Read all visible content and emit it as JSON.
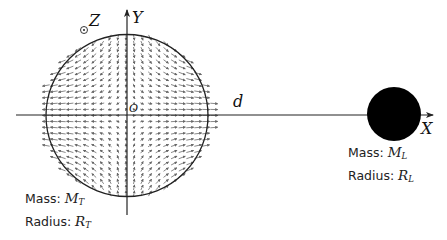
{
  "diagram": {
    "axes": {
      "x_label": "X",
      "y_label": "Y",
      "z_label": "Z",
      "origin_label": "O",
      "distance_label": "d"
    },
    "earth": {
      "center": [
        127,
        115
      ],
      "radius": 81,
      "mass_prefix": "Mass: ",
      "mass_symbol": "M",
      "mass_sub": "T",
      "radius_prefix": "Radius: ",
      "radius_symbol": "R",
      "radius_sub": "T"
    },
    "moon": {
      "center": [
        394,
        114
      ],
      "radius": 27,
      "color": "#000000",
      "mass_prefix": "Mass: ",
      "mass_symbol": "M",
      "mass_sub": "L",
      "radius_prefix": "Radius: ",
      "radius_symbol": "R",
      "radius_sub": "L"
    },
    "field": {
      "type": "tidal",
      "grid_dx": 8,
      "grid_dy": 6,
      "color": "#555555"
    },
    "colors": {
      "line": "#222222",
      "background": "#ffffff"
    }
  }
}
